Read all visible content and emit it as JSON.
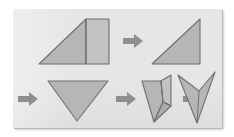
{
  "diagram": {
    "title": "Paper folding sequence",
    "background_color": "#ffffff",
    "panel_color": "#e6e6e4",
    "panel_border_color": "#b9b9b7",
    "shape_fill_color": "#b6b6b4",
    "shape_outline_color": "#6f6f6d",
    "arrow_color": "#8f8f8d",
    "step_count": 5,
    "arrow_count": 4
  },
  "rows": [
    {
      "name": "top-row",
      "items": [
        {
          "kind": "shape",
          "name": "step-1-trapezoid-with-fold-line",
          "label": "Step 1",
          "description": "Right trapezoid with a vertical crease line dividing a left triangle from a right rectangle"
        },
        {
          "kind": "arrow",
          "name": "arrow-1",
          "label": "Arrow 1",
          "direction": "right"
        },
        {
          "kind": "shape",
          "name": "step-2-right-triangle",
          "label": "Step 2",
          "description": "Right triangle with the right angle at the bottom right"
        }
      ]
    },
    {
      "name": "bottom-row",
      "items": [
        {
          "kind": "arrow",
          "name": "arrow-2",
          "label": "Arrow 2",
          "direction": "right"
        },
        {
          "kind": "shape",
          "name": "step-3-downward-triangle",
          "label": "Step 3",
          "description": "Wide triangle pointing downward"
        },
        {
          "kind": "arrow",
          "name": "arrow-3",
          "label": "Arrow 3",
          "direction": "right"
        },
        {
          "kind": "shape",
          "name": "step-4-folded-dart",
          "label": "Step 4",
          "description": "Downward triangle with its right half folded inward, showing crease lines"
        },
        {
          "kind": "arrow",
          "name": "arrow-4",
          "label": "Arrow 4",
          "direction": "right"
        },
        {
          "kind": "shape",
          "name": "step-5-arrowhead-dart",
          "label": "Step 5",
          "description": "Concave arrowhead or dart shape pointing downward"
        }
      ]
    }
  ]
}
